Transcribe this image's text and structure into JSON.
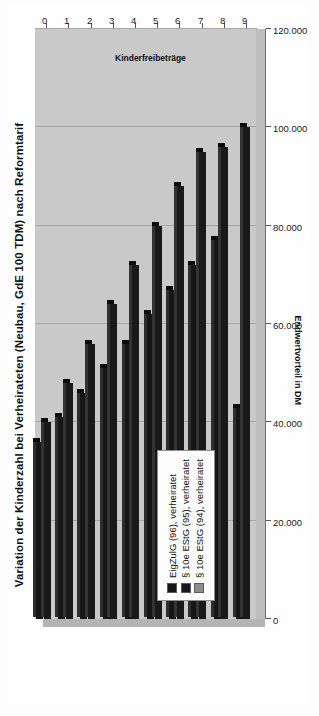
{
  "figure": {
    "title": "Variation der Kinderzahl bei Verheirateten (Neubau, GdE 100 TDM) nach Reformtarif"
  },
  "chart_data": {
    "type": "bar",
    "orientation": "horizontal",
    "title": "Variation der Kinderzahl bei Verheirateten (Neubau, GdE 100 TDM) nach Reformtarif",
    "xlabel": "Kinderfreibeträge",
    "ylabel": "Endwertvorteil in DM",
    "categories": [
      "0",
      "1",
      "2",
      "3",
      "4",
      "5",
      "6",
      "7",
      "8",
      "9"
    ],
    "ylim": [
      0,
      120000
    ],
    "yticks": [
      0,
      20000,
      40000,
      60000,
      80000,
      100000,
      120000
    ],
    "ytick_labels": [
      "0",
      "20.000",
      "40.000",
      "60.000",
      "80.000",
      "100.000",
      "120.000"
    ],
    "grid": true,
    "legend_position": "inside-left",
    "series": [
      {
        "name": "EigZulG (96), verheiratet",
        "color": "#161616",
        "values": [
          36000,
          41000,
          46000,
          51000,
          56000,
          62000,
          67000,
          72000,
          77000,
          43000
        ]
      },
      {
        "name": "§ 10e EStG (95), verheiratet",
        "color": "#191919",
        "values": [
          40000,
          48000,
          56000,
          64000,
          72000,
          80000,
          88000,
          95000,
          96000,
          100000
        ]
      },
      {
        "name": "§ 10e EStG (94), verheiratet",
        "color": "#8d8d8d",
        "values": [
          0,
          0,
          0,
          0,
          0,
          0,
          0,
          0,
          0,
          0
        ]
      }
    ]
  },
  "legend": {
    "items": [
      {
        "label": "EigZulG (96), verheiratet"
      },
      {
        "label": "§ 10e EStG (95), verheiratet"
      },
      {
        "label": "§ 10e EStG (94), verheiratet"
      }
    ]
  }
}
